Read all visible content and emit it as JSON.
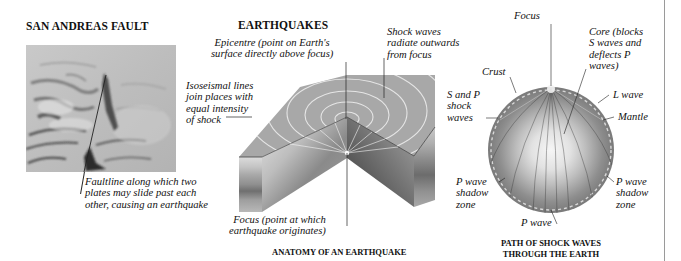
{
  "panels": {
    "san_andreas": {
      "title": "SAN ANDREAS FAULT",
      "photo_alt": "aerial-photo-of-san-andreas-fault",
      "faultline_label": "Faultline along which two\nplates may slide past each\nother, causing an earthquake"
    },
    "earthquakes": {
      "title": "EARTHQUAKES",
      "caption": "ANATOMY OF AN EARTHQUAKE",
      "labels": {
        "epicentre": "Epicentre (point on Earth's\nsurface directly above focus)",
        "shock_waves": "Shock waves\nradiate outwards\nfrom focus",
        "isoseismal": "Isoseismal lines\njoin places with\nequal intensity\nof shock",
        "focus": "Focus (point at which\nearthquake originates)"
      }
    },
    "earth_path": {
      "caption_line1": "PATH OF SHOCK WAVES",
      "caption_line2": "THROUGH THE EARTH",
      "labels": {
        "focus": "Focus",
        "core": "Core (blocks\nS waves and\ndeflects P\nwaves)",
        "crust": "Crust",
        "s_and_p": "S and P\nshock\nwaves",
        "l_wave": "L wave",
        "mantle": "Mantle",
        "p_shadow_left": "P wave\nshadow\nzone",
        "p_shadow_right": "P wave\nshadow\nzone",
        "p_wave": "P wave"
      }
    }
  },
  "colors": {
    "surface_top": "#a6a6a6",
    "layer_light": "#d9d9d9",
    "layer_mid": "#9c9c9c",
    "layer_dark": "#6e6e6e",
    "mantle": "#7d7d7d",
    "core_glow": "#f4f4f4",
    "ring": "#e8e8e8"
  }
}
